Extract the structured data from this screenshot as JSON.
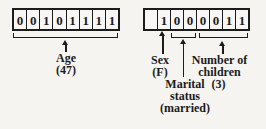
{
  "figure": {
    "age_field": {
      "bits": [
        "0",
        "0",
        "1",
        "0",
        "1",
        "1",
        "1",
        "1"
      ],
      "label": "Age",
      "value": "(47)"
    },
    "packed_field": {
      "bits": [
        "",
        "1",
        "0",
        "0",
        "0",
        "0",
        "1",
        "1"
      ],
      "sex": {
        "label": "Sex",
        "value": "(F)"
      },
      "marital_status": {
        "label_line1": "Marital",
        "label_line2": "status",
        "value": "(married)"
      },
      "children": {
        "label_line1": "Number of",
        "label_line2": "children",
        "value": "(3)"
      }
    },
    "colors": {
      "ink": "#1c1c1c",
      "paper": "#f5f4f1"
    }
  }
}
